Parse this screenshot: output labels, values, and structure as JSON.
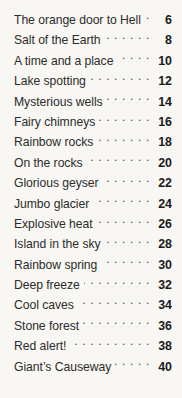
{
  "document": {
    "type": "table-of-contents",
    "background_color": "#f8f7f3",
    "text_color": "#2c2c2c",
    "page_number_color": "#1b1b1b",
    "leader_character": "."
  },
  "entries": [
    {
      "title": "The orange door to Hell",
      "page": "6"
    },
    {
      "title": "Salt of the Earth",
      "page": "8"
    },
    {
      "title": "A time and a place",
      "page": "10"
    },
    {
      "title": "Lake spotting",
      "page": "12"
    },
    {
      "title": "Mysterious wells",
      "page": "14"
    },
    {
      "title": "Fairy chimneys",
      "page": "16"
    },
    {
      "title": "Rainbow rocks",
      "page": "18"
    },
    {
      "title": "On the rocks",
      "page": "20"
    },
    {
      "title": "Glorious geyser",
      "page": "22"
    },
    {
      "title": "Jumbo glacier",
      "page": "24"
    },
    {
      "title": "Explosive heat",
      "page": "26"
    },
    {
      "title": "Island in the sky",
      "page": "28"
    },
    {
      "title": "Rainbow spring",
      "page": "30"
    },
    {
      "title": "Deep freeze",
      "page": "32"
    },
    {
      "title": "Cool caves",
      "page": "34"
    },
    {
      "title": "Stone forest",
      "page": "36"
    },
    {
      "title": "Red alert!",
      "page": "38"
    },
    {
      "title": "Giant’s Causeway",
      "page": "40"
    }
  ]
}
